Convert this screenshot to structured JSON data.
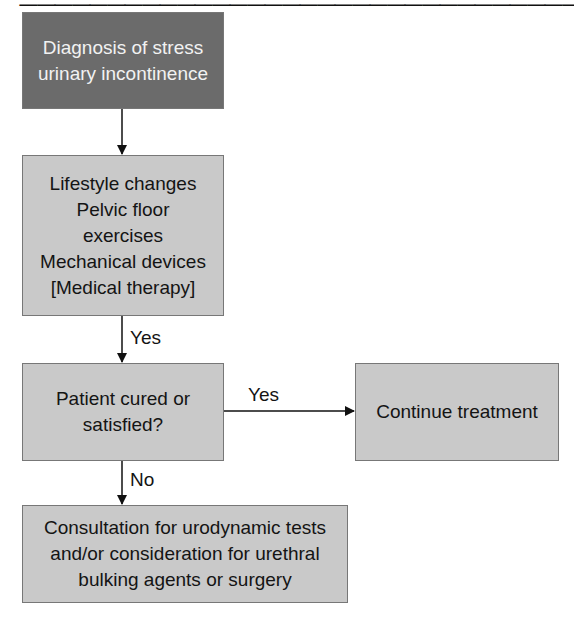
{
  "diagram": {
    "nodes": [
      {
        "id": "diagnosis",
        "text": "Diagnosis of stress\nurinary incontinence"
      },
      {
        "id": "conservative",
        "text": "Lifestyle changes\nPelvic floor\nexercises\nMechanical devices\n[Medical therapy]"
      },
      {
        "id": "decision",
        "text": "Patient cured or\nsatisfied?"
      },
      {
        "id": "continue",
        "text": "Continue treatment"
      },
      {
        "id": "consultation",
        "text": "Consultation for urodynamic tests\nand/or consideration for urethral\nbulking agents or surgery"
      }
    ],
    "edges": [
      {
        "from": "diagnosis",
        "to": "conservative",
        "label": ""
      },
      {
        "from": "conservative",
        "to": "decision",
        "label": "Yes"
      },
      {
        "from": "decision",
        "to": "continue",
        "label": "Yes"
      },
      {
        "from": "decision",
        "to": "consultation",
        "label": "No"
      }
    ],
    "colors": {
      "start_node": "#6b6b6b",
      "node": "#c9c9c9",
      "line": "#111111"
    }
  }
}
